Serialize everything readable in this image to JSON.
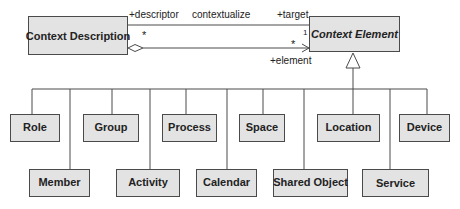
{
  "classes": {
    "context_description": "Context Description",
    "context_element": "Context Element"
  },
  "association": {
    "name": "contextualize",
    "source_role": "+descriptor",
    "source_multiplicity": "*",
    "target_role": "+target",
    "target_multiplicity": "1"
  },
  "aggregation": {
    "target_role": "+element",
    "target_multiplicity": "*"
  },
  "subclasses": {
    "top_row": [
      "Role",
      "Group",
      "Process",
      "Space",
      "Location",
      "Device"
    ],
    "bottom_row": [
      "Member",
      "Activity",
      "Calendar",
      "Shared Object",
      "Service"
    ]
  },
  "colors": {
    "box_fill": "#e3e3e3",
    "line": "#4a4a4a"
  }
}
